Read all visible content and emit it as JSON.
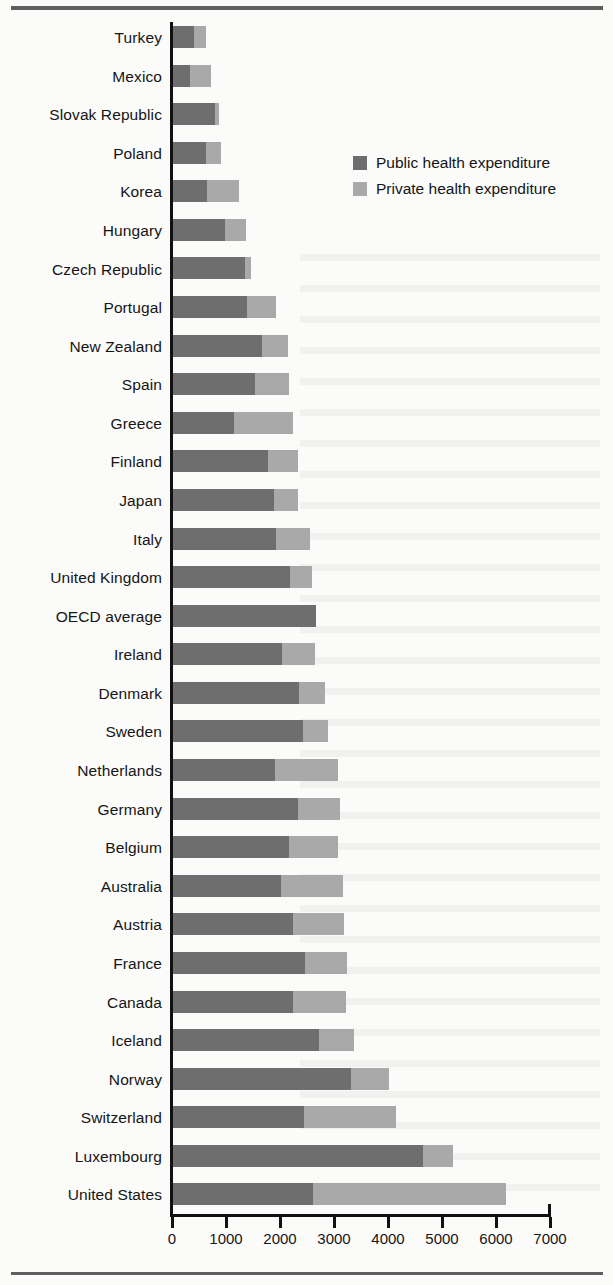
{
  "chart_data": {
    "type": "bar",
    "orientation": "horizontal",
    "stacked": true,
    "title": "",
    "xlabel": "",
    "ylabel": "",
    "xlim": [
      0,
      7000
    ],
    "xticks": [
      0,
      1000,
      2000,
      3000,
      4000,
      5000,
      6000,
      7000
    ],
    "xtick_labels": [
      "0",
      "1000",
      "2000",
      "3000",
      "4000",
      "5000",
      "6000",
      "7000"
    ],
    "grid": false,
    "legend_position": "upper-right-inside",
    "legend": [
      "Public health expenditure",
      "Private health expenditure"
    ],
    "categories": [
      "Turkey",
      "Mexico",
      "Slovak Republic",
      "Poland",
      "Korea",
      "Hungary",
      "Czech Republic",
      "Portugal",
      "New Zealand",
      "Spain",
      "Greece",
      "Finland",
      "Japan",
      "Italy",
      "United Kingdom",
      "OECD average",
      "Ireland",
      "Denmark",
      "Sweden",
      "Netherlands",
      "Germany",
      "Belgium",
      "Australia",
      "Austria",
      "France",
      "Canada",
      "Iceland",
      "Norway",
      "Switzerland",
      "Luxembourg",
      "United States"
    ],
    "series": [
      {
        "name": "Public health expenditure",
        "color": "#6e6e6e",
        "values": [
          390,
          310,
          780,
          620,
          630,
          960,
          1330,
          1370,
          1650,
          1520,
          1130,
          1750,
          1870,
          1910,
          2170,
          2650,
          2020,
          2330,
          2400,
          1890,
          2320,
          2150,
          2000,
          2230,
          2440,
          2220,
          2710,
          3300,
          2430,
          4630,
          2590
        ]
      },
      {
        "name": "Private health expenditure",
        "color": "#a9a9a9",
        "values": [
          220,
          400,
          70,
          260,
          600,
          390,
          110,
          540,
          480,
          620,
          1100,
          560,
          450,
          630,
          400,
          0,
          610,
          480,
          470,
          1170,
          780,
          900,
          1140,
          930,
          780,
          980,
          640,
          700,
          1700,
          550,
          3580
        ]
      }
    ],
    "totals": [
      610,
      710,
      850,
      880,
      1230,
      1350,
      1440,
      1910,
      2130,
      2140,
      2230,
      2310,
      2320,
      2540,
      2570,
      2650,
      2630,
      2810,
      2870,
      3060,
      3100,
      3050,
      3140,
      3160,
      3220,
      3200,
      3350,
      4000,
      4130,
      5180,
      6170
    ]
  },
  "legend": {
    "items": [
      {
        "label": "Public health expenditure",
        "color": "#6e6e6e"
      },
      {
        "label": "Private health expenditure",
        "color": "#a9a9a9"
      }
    ]
  },
  "axis": {
    "tick_labels": [
      "0",
      "1000",
      "2000",
      "3000",
      "4000",
      "5000",
      "6000",
      "7000"
    ]
  }
}
